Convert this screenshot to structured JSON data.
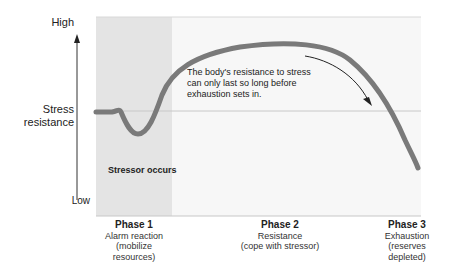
{
  "diagram": {
    "y_axis": {
      "label_line1": "Stress",
      "label_line2": "resistance",
      "high": "High",
      "low": "Low"
    },
    "annotation": {
      "line1": "The body's resistance to stress",
      "line2": "can only last so long before",
      "line3": "exhaustion sets in."
    },
    "stressor_label": "Stressor occurs",
    "phases": [
      {
        "title": "Phase 1",
        "line1": "Alarm reaction",
        "line2": "(mobilize",
        "line3": "resources)"
      },
      {
        "title": "Phase 2",
        "line1": "Resistance",
        "line2": "(cope with stressor)",
        "line3": ""
      },
      {
        "title": "Phase 3",
        "line1": "Exhaustion",
        "line2": "(reserves",
        "line3": "depleted)"
      }
    ],
    "colors": {
      "curve": "#7a7a7a",
      "alarm_shade": "#e4e4e4",
      "plot_bg": "#f7f7f7",
      "baseline": "#c8c8c8"
    }
  }
}
